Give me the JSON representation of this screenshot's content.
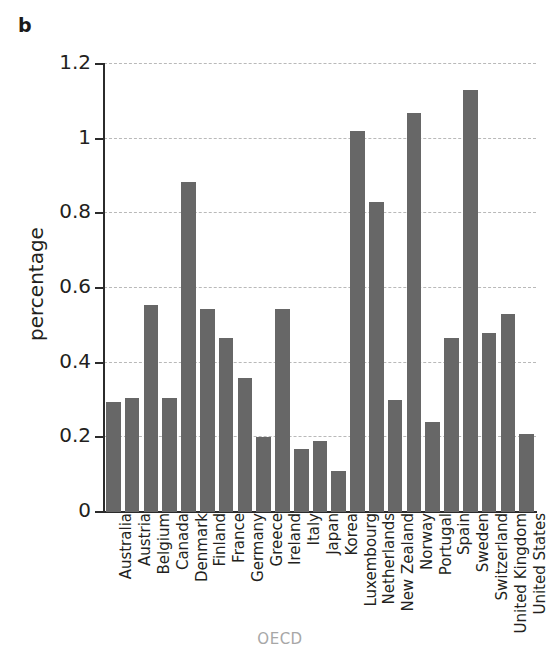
{
  "figure": {
    "panel_letter": "b",
    "background_color": "#ffffff",
    "bar_color": "#676767",
    "axis_color": "#2b2b2b",
    "gridline_color": "#b9b9b9",
    "xlabel_color": "#a7a7a7"
  },
  "chart_data": {
    "type": "bar",
    "title": "",
    "xlabel": "OECD",
    "ylabel": "percentage",
    "ylim": [
      0,
      1.2
    ],
    "yticks": [
      0,
      0.2,
      0.4,
      0.6,
      0.8,
      1,
      1.2
    ],
    "ytick_labels": [
      "0",
      "0.2",
      "0.4",
      "0.6",
      "0.8",
      "1",
      "1.2"
    ],
    "grid": true,
    "grid_axis": "y",
    "legend": false,
    "categories": [
      "Australia",
      "Austria",
      "Belgium",
      "Canada",
      "Denmark",
      "Finland",
      "France",
      "Germany",
      "Greece",
      "Ireland",
      "Italy",
      "Japan",
      "Korea",
      "Luxembourg",
      "Netherlands",
      "New Zealand",
      "Norway",
      "Portugal",
      "Spain",
      "Sweden",
      "Switzerland",
      "United Kingdom",
      "United States"
    ],
    "values": [
      0.295,
      0.305,
      0.555,
      0.305,
      0.885,
      0.545,
      0.465,
      0.36,
      0.2,
      0.545,
      0.17,
      0.19,
      0.11,
      1.02,
      0.83,
      0.3,
      1.07,
      0.24,
      0.465,
      1.13,
      0.48,
      0.53,
      0.21
    ]
  }
}
